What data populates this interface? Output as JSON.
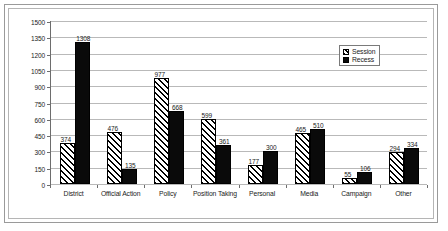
{
  "chart_data": {
    "type": "bar",
    "title": "",
    "xlabel": "",
    "ylabel": "",
    "ylim": [
      0,
      1500
    ],
    "ytick_step": 150,
    "yticks": [
      "0",
      "150",
      "300",
      "450",
      "600",
      "750",
      "900",
      "1050",
      "1200",
      "1350",
      "1500"
    ],
    "grid": true,
    "legend_position": "top-right",
    "categories": [
      "District",
      "Official Action",
      "Policy",
      "Position Taking",
      "Personal",
      "Media",
      "Campaign",
      "Other"
    ],
    "series": [
      {
        "name": "Session",
        "pattern": "diagonal-hatch",
        "values": [
          374,
          476,
          977,
          599,
          177,
          465,
          55,
          294
        ]
      },
      {
        "name": "Recess",
        "pattern": "solid-black",
        "values": [
          1308,
          135,
          668,
          361,
          300,
          510,
          106,
          334
        ]
      }
    ]
  },
  "legend": {
    "items": [
      {
        "label": "Session",
        "swatch": "hatch-swatch-icon"
      },
      {
        "label": "Recess",
        "swatch": "solid-swatch-icon"
      }
    ]
  },
  "colors": {
    "session_fill": "#ffffff",
    "session_hatch": "#000000",
    "recess_fill": "#0a0a0a",
    "gridline": "#b9b9b9",
    "axis": "#6d6d6d",
    "frame": "#9a9a9a",
    "text": "#1a1a1a",
    "background": "#ffffff"
  }
}
